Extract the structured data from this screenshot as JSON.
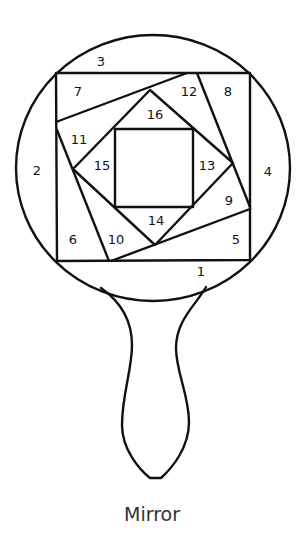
{
  "caption": "Mirror",
  "colors": {
    "line": "#111111",
    "background": "#ffffff",
    "caption": "#333333"
  },
  "labels": [
    {
      "id": "1",
      "text": "1",
      "x": 201,
      "y": 272
    },
    {
      "id": "2",
      "text": "2",
      "x": 37,
      "y": 171
    },
    {
      "id": "3",
      "text": "3",
      "x": 101,
      "y": 62
    },
    {
      "id": "4",
      "text": "4",
      "x": 268,
      "y": 172
    },
    {
      "id": "5",
      "text": "5",
      "x": 236,
      "y": 240
    },
    {
      "id": "6",
      "text": "6",
      "x": 73,
      "y": 240
    },
    {
      "id": "7",
      "text": "7",
      "x": 78,
      "y": 92
    },
    {
      "id": "8",
      "text": "8",
      "x": 228,
      "y": 92
    },
    {
      "id": "9",
      "text": "9",
      "x": 229,
      "y": 201
    },
    {
      "id": "10",
      "text": "10",
      "x": 116,
      "y": 240
    },
    {
      "id": "11",
      "text": "11",
      "x": 79,
      "y": 140
    },
    {
      "id": "12",
      "text": "12",
      "x": 189,
      "y": 92
    },
    {
      "id": "13",
      "text": "13",
      "x": 207,
      "y": 166
    },
    {
      "id": "14",
      "text": "14",
      "x": 156,
      "y": 221
    },
    {
      "id": "15",
      "text": "15",
      "x": 102,
      "y": 166
    },
    {
      "id": "16",
      "text": "16",
      "x": 155,
      "y": 115
    }
  ]
}
